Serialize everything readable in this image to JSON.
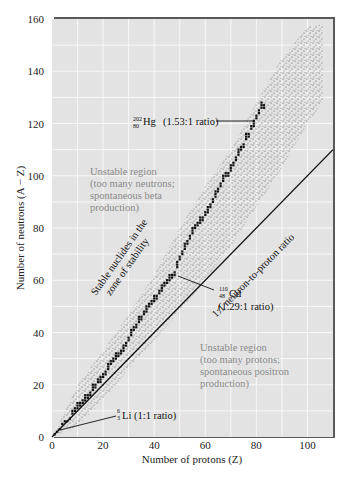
{
  "chart_data": {
    "type": "scatter",
    "title": "",
    "xlabel": "Number of protons (Z)",
    "ylabel": "Number of neutrons (A − Z)",
    "xlim": [
      0,
      110
    ],
    "ylim": [
      0,
      160
    ],
    "xticks": [
      0,
      20,
      40,
      60,
      80,
      100
    ],
    "yticks": [
      0,
      20,
      40,
      60,
      80,
      100,
      120,
      140,
      160
    ],
    "grid": true,
    "series": [
      {
        "name": "Band of known nuclides (stippled)",
        "upper_edge": [
          [
            0,
            0
          ],
          [
            10,
            20
          ],
          [
            20,
            33
          ],
          [
            30,
            47
          ],
          [
            40,
            62
          ],
          [
            50,
            80
          ],
          [
            60,
            96
          ],
          [
            70,
            110
          ],
          [
            80,
            128
          ],
          [
            90,
            145
          ],
          [
            100,
            157
          ],
          [
            106,
            158
          ]
        ],
        "lower_edge": [
          [
            0,
            0
          ],
          [
            10,
            4
          ],
          [
            20,
            14
          ],
          [
            30,
            26
          ],
          [
            40,
            37
          ],
          [
            50,
            48
          ],
          [
            60,
            60
          ],
          [
            70,
            73
          ],
          [
            80,
            88
          ],
          [
            90,
            103
          ],
          [
            100,
            120
          ],
          [
            106,
            128
          ]
        ]
      },
      {
        "name": "Stable nuclides (zone of stability)",
        "values": [
          [
            1,
            1
          ],
          [
            2,
            2
          ],
          [
            3,
            3
          ],
          [
            4,
            5
          ],
          [
            5,
            6
          ],
          [
            6,
            6
          ],
          [
            7,
            7
          ],
          [
            8,
            9
          ],
          [
            9,
            10
          ],
          [
            10,
            11
          ],
          [
            11,
            12
          ],
          [
            12,
            13
          ],
          [
            13,
            14
          ],
          [
            14,
            15
          ],
          [
            15,
            16
          ],
          [
            16,
            18
          ],
          [
            17,
            19
          ],
          [
            18,
            21
          ],
          [
            19,
            21
          ],
          [
            20,
            23
          ],
          [
            21,
            24
          ],
          [
            22,
            26
          ],
          [
            23,
            28
          ],
          [
            24,
            29
          ],
          [
            25,
            30
          ],
          [
            26,
            31
          ],
          [
            27,
            32
          ],
          [
            28,
            33
          ],
          [
            29,
            35
          ],
          [
            30,
            37
          ],
          [
            31,
            39
          ],
          [
            32,
            41
          ],
          [
            33,
            42
          ],
          [
            34,
            44
          ],
          [
            35,
            45
          ],
          [
            36,
            47
          ],
          [
            37,
            48
          ],
          [
            38,
            50
          ],
          [
            39,
            51
          ],
          [
            40,
            52
          ],
          [
            41,
            53
          ],
          [
            42,
            55
          ],
          [
            43,
            56
          ],
          [
            44,
            58
          ],
          [
            45,
            59
          ],
          [
            46,
            60
          ],
          [
            47,
            61
          ],
          [
            48,
            62
          ],
          [
            49,
            65
          ],
          [
            50,
            68
          ],
          [
            51,
            70
          ],
          [
            52,
            72
          ],
          [
            53,
            74
          ],
          [
            54,
            76
          ],
          [
            55,
            78
          ],
          [
            56,
            80
          ],
          [
            57,
            81
          ],
          [
            58,
            82
          ],
          [
            59,
            83
          ],
          [
            60,
            85
          ],
          [
            61,
            86
          ],
          [
            62,
            88
          ],
          [
            63,
            90
          ],
          [
            64,
            92
          ],
          [
            65,
            94
          ],
          [
            66,
            96
          ],
          [
            67,
            98
          ],
          [
            68,
            100
          ],
          [
            69,
            100
          ],
          [
            70,
            102
          ],
          [
            71,
            104
          ],
          [
            72,
            106
          ],
          [
            73,
            108
          ],
          [
            74,
            110
          ],
          [
            75,
            111
          ],
          [
            76,
            114
          ],
          [
            77,
            115
          ],
          [
            78,
            118
          ],
          [
            79,
            119
          ],
          [
            80,
            122
          ],
          [
            81,
            124
          ],
          [
            82,
            126
          ],
          [
            83,
            126
          ]
        ]
      },
      {
        "name": "1:1 neutron-to-proton ratio",
        "type": "line",
        "values": [
          [
            0,
            0
          ],
          [
            110,
            110
          ]
        ]
      }
    ],
    "annotations": [
      {
        "text": "Unstable region (too many neutrons; spontaneous beta production)",
        "x": 19,
        "y": 104
      },
      {
        "text": "Unstable region (too many protons; spontaneous positron production)",
        "x": 59,
        "y": 47
      },
      {
        "text": "Stable nuclides in the zone of stability",
        "x": 17,
        "y": 60,
        "rotation": -55
      },
      {
        "text": "1:1 neutron-to-proton ratio",
        "x": 70,
        "y": 74,
        "rotation": -45
      },
      {
        "text": "202/80 Hg (1.53:1 ratio)",
        "points_to": [
          80,
          121
        ]
      },
      {
        "text": "110/48 Cd (1.29:1 ratio)",
        "points_to": [
          48,
          62
        ]
      },
      {
        "text": "6/3 Li (1:1 ratio)",
        "points_to": [
          2,
          3
        ]
      }
    ]
  },
  "labels": {
    "xlabel": "Number of protons (Z)",
    "ylabel": "Number of neutrons (A − Z)",
    "region_neutrons": [
      "Unstable region",
      "(too many neutrons;",
      "spontaneous beta",
      "production)"
    ],
    "region_protons": [
      "Unstable region",
      "(too many protons;",
      "spontaneous positron",
      "production)"
    ],
    "stable_line1": "Stable nuclides in the",
    "stable_line2": "zone of stability",
    "ratio_line": "1:1 neutron-to-proton ratio",
    "hg": {
      "mass": "202",
      "atomic": "80",
      "symbol": "Hg",
      "ratio": "(1.53:1 ratio)"
    },
    "cd": {
      "mass": "110",
      "atomic": "48",
      "symbol": "Cd",
      "ratio": "(1.29:1 ratio)"
    },
    "li": {
      "mass": "6",
      "atomic": "3",
      "symbol": "Li",
      "ratio": "(1:1 ratio)"
    }
  },
  "colors": {
    "plot_bg": "#e3e3e3",
    "grid": "#f7f7f7",
    "frame": "#5a5a5a",
    "stipple": "#555555",
    "stable": "#111111",
    "region_text": "#8a8a8a"
  }
}
